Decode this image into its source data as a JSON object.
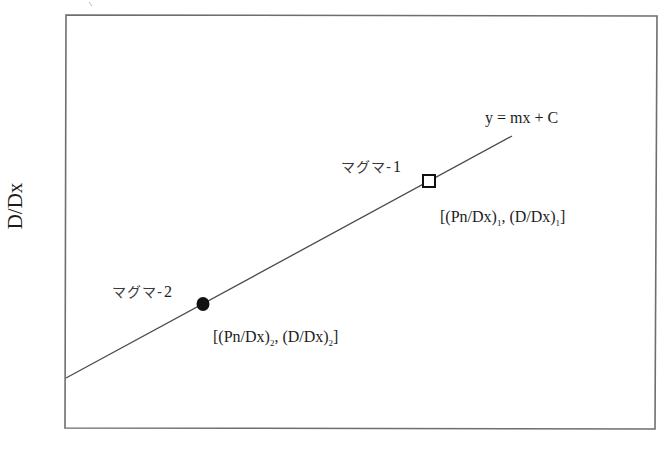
{
  "diagram": {
    "y_axis_label": "D/Dx",
    "x_axis_label": "",
    "line_equation": "y = mx + C",
    "points": [
      {
        "name": "マグマ-1",
        "label_main": "マグマ-",
        "label_num": "1",
        "marker": "open-square",
        "coord_open": "[(Pn/Dx)",
        "coord_sub1": "1",
        "coord_mid": ", (D/Dx)",
        "coord_sub2": "1",
        "coord_close": "]"
      },
      {
        "name": "マグマ-2",
        "label_main": "マグマ-",
        "label_num": "2",
        "marker": "filled-circle",
        "coord_open": "[(Pn/Dx)",
        "coord_sub1": "2",
        "coord_mid": ", (D/Dx)",
        "coord_sub2": "2",
        "coord_close": "]"
      }
    ],
    "colors": {
      "frame": "#6e6e6e",
      "line": "#4a4a4a",
      "marker": "#111111",
      "text": "#1c1c1c"
    }
  }
}
